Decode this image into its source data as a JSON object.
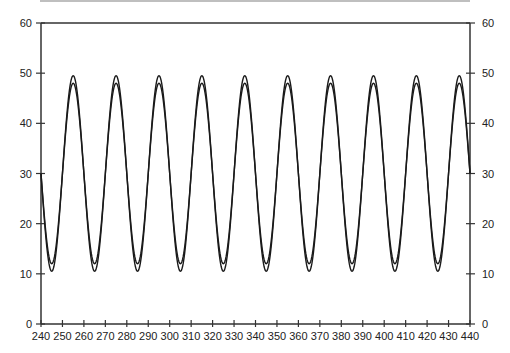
{
  "chart_data": {
    "type": "line",
    "title": "",
    "xlabel": "",
    "ylabel": "",
    "xlim": [
      240,
      440
    ],
    "ylim": [
      0,
      60
    ],
    "grid": false,
    "legend": null,
    "x_ticks": [
      240,
      250,
      260,
      270,
      280,
      290,
      300,
      310,
      320,
      330,
      340,
      350,
      360,
      370,
      380,
      390,
      400,
      410,
      420,
      430,
      440
    ],
    "y_ticks_left": [
      0,
      10,
      20,
      30,
      40,
      50,
      60
    ],
    "y_ticks_right": [
      0,
      10,
      20,
      30,
      40,
      50,
      60
    ],
    "series": [
      {
        "name": "outer",
        "form": "sinusoid",
        "period": 20,
        "peak_x": 255,
        "max": 49.5,
        "min": 10.5
      },
      {
        "name": "inner",
        "form": "sinusoid",
        "period": 20,
        "peak_x": 255,
        "max": 48,
        "min": 12
      }
    ],
    "peaks_x": [
      255,
      275,
      295,
      315,
      335,
      355,
      375,
      395,
      415,
      425
    ],
    "troughs_x": [
      245,
      265,
      285,
      305,
      325,
      345,
      365,
      385,
      405,
      433
    ]
  },
  "colors": {
    "line": "#1a1a1a",
    "axis": "#333333",
    "top_rule": "#999999"
  }
}
